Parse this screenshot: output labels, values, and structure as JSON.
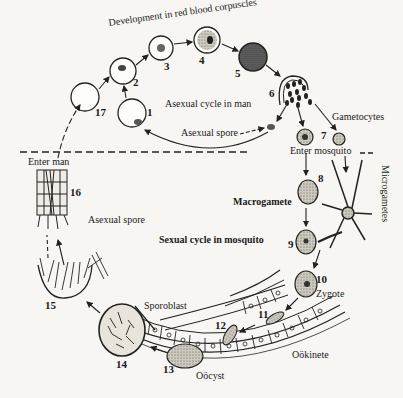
{
  "diagram": {
    "regions": {
      "upper": "Asexual cycle in man",
      "lower": "Sexual cycle in mosquito"
    },
    "labels": {
      "development": "Development in red blood corpuscles",
      "asexual_cycle": "Asexual cycle in man",
      "asexual_spore_top": "Asexual spore",
      "gametocytes": "Gametocytes",
      "enter_man": "Enter  man",
      "enter_mosquito": "Enter mosquito",
      "macrogamete": "Macrogamete",
      "microgametes": "Microgametes",
      "sexual_cycle": "Sexual cycle in mosquito",
      "asexual_spore_bottom": "Asexual spore",
      "sporoblast": "Sporoblast",
      "zygote": "Zygote",
      "ookinete": "Oökinete",
      "oocyst": "Oöcyst"
    },
    "stages": [
      "1",
      "2",
      "3",
      "4",
      "5",
      "6",
      "7",
      "8",
      "9",
      "10",
      "11",
      "12",
      "13",
      "14",
      "15",
      "16",
      "17"
    ]
  }
}
